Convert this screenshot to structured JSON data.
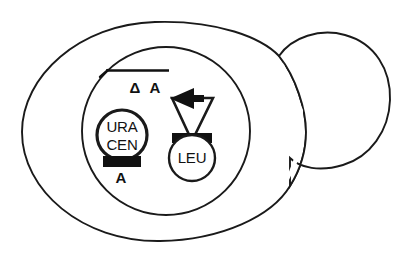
{
  "figure": {
    "ink_color": "#111111",
    "background_color": "#ffffff",
    "line_color": "#1a1a1a"
  },
  "cell": {
    "mother_label": "mother-cell-outline",
    "bud_label": "bud-outline"
  },
  "nucleus": {
    "label": "nucleus-outline"
  },
  "chromosome": {
    "marker_label": "Δ A",
    "delta_symbol": "Δ",
    "allele_symbol": "A"
  },
  "plasmid_ura_cen": {
    "line1": "URA",
    "line2": "CEN",
    "marker_label": "A"
  },
  "plasmid_leu": {
    "label": "LEU"
  },
  "element_names": {
    "chromosome_line": "chromosome-bar",
    "inversion_triangle": "inversion-triangle",
    "arrowhead": "left-arrowhead",
    "ura_cen_black_bar": "ura-cen-insert-bar",
    "leu_black_bar": "leu-insert-bar"
  }
}
